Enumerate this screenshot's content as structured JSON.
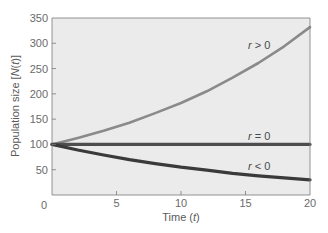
{
  "chart_data": {
    "type": "line",
    "title": "",
    "xlabel": "Time (t)",
    "ylabel": "Population size [N(t)]",
    "xlim": [
      0,
      20
    ],
    "ylim": [
      0,
      350
    ],
    "xticks": [
      0,
      5,
      10,
      15,
      20
    ],
    "yticks": [
      0,
      50,
      100,
      150,
      200,
      250,
      300,
      350
    ],
    "grid": false,
    "legend": "inline labels",
    "x": [
      0,
      2,
      4,
      6,
      8,
      10,
      12,
      14,
      16,
      18,
      20
    ],
    "series": [
      {
        "name": "r > 0",
        "label": "r > 0",
        "color": "#8a8a8a",
        "values": [
          100,
          113,
          127,
          143,
          162,
          182,
          205,
          232,
          261,
          294,
          332
        ]
      },
      {
        "name": "r = 0",
        "label": "r = 0",
        "color": "#4d4d4d",
        "values": [
          100,
          100,
          100,
          100,
          100,
          100,
          100,
          100,
          100,
          100,
          100
        ]
      },
      {
        "name": "r < 0",
        "label": "r < 0",
        "color": "#3a3a3a",
        "values": [
          100,
          89,
          79,
          70,
          62,
          55,
          49,
          43,
          38,
          34,
          30
        ]
      }
    ]
  },
  "labels": {
    "xlabel": "Time (",
    "xlabel_var": "t",
    "xlabel_end": ")",
    "ylabel": "Population size [",
    "ylabel_var": "N",
    "ylabel_mid": "(",
    "ylabel_var2": "t",
    "ylabel_end": ")]",
    "r_pos_var": "r",
    "r_pos_rel": " > 0",
    "r_zero_var": "r",
    "r_zero_rel": " = 0",
    "r_neg_var": "r",
    "r_neg_rel": " < 0"
  },
  "colors": {
    "plot_bg": "#ebebeb",
    "axis": "#6a6a6a"
  }
}
